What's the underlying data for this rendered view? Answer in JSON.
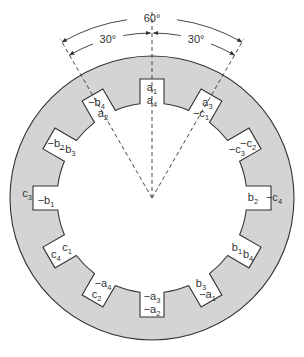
{
  "diagram": {
    "type": "stator-winding-slots",
    "colors": {
      "stator_fill": "#d4d4d4",
      "stroke": "#333333",
      "background": "#ffffff"
    },
    "geometry": {
      "center": [
        152,
        198
      ],
      "outer_radius": 142,
      "inner_radius": 95,
      "slot_outer_radius": 119,
      "slot_half_width": 12,
      "slot_count": 12,
      "slot_pitch_deg": 30
    },
    "dimensions": {
      "total": "60°",
      "left": "30°",
      "right": "30°"
    },
    "slots": [
      {
        "angle": 0,
        "outer": {
          "sign": "",
          "letter": "a",
          "sub": "1"
        },
        "inner": {
          "sign": "",
          "letter": "a",
          "sub": "4"
        }
      },
      {
        "angle": 30,
        "outer": {
          "sign": "",
          "letter": "a",
          "sub": "3"
        },
        "inner": {
          "sign": "−",
          "letter": "c",
          "sub": "1"
        }
      },
      {
        "angle": 60,
        "outer": {
          "sign": "−",
          "letter": "c",
          "sub": "2"
        },
        "inner": {
          "sign": "−",
          "letter": "c",
          "sub": "3"
        }
      },
      {
        "angle": 90,
        "outer": {
          "sign": "−",
          "letter": "c",
          "sub": "4"
        },
        "inner": {
          "sign": "",
          "letter": "b",
          "sub": "2"
        }
      },
      {
        "angle": 120,
        "outer": {
          "sign": "",
          "letter": "b",
          "sub": "4"
        },
        "inner": {
          "sign": "",
          "letter": "b",
          "sub": "1"
        }
      },
      {
        "angle": 150,
        "outer": {
          "sign": "−",
          "letter": "a",
          "sub": "1"
        },
        "inner": {
          "sign": "",
          "letter": "b",
          "sub": "3"
        }
      },
      {
        "angle": 180,
        "outer": {
          "sign": "−",
          "letter": "a",
          "sub": "2"
        },
        "inner": {
          "sign": "−",
          "letter": "a",
          "sub": "3"
        }
      },
      {
        "angle": 210,
        "outer": {
          "sign": "",
          "letter": "c",
          "sub": "2"
        },
        "inner": {
          "sign": "−",
          "letter": "a",
          "sub": "4"
        }
      },
      {
        "angle": 240,
        "outer": {
          "sign": "",
          "letter": "c",
          "sub": "4"
        },
        "inner": {
          "sign": "",
          "letter": "c",
          "sub": "1"
        }
      },
      {
        "angle": 270,
        "outer": {
          "sign": "",
          "letter": "c",
          "sub": "3"
        },
        "inner": {
          "sign": "−",
          "letter": "b",
          "sub": "1"
        }
      },
      {
        "angle": 300,
        "outer": {
          "sign": "−",
          "letter": "b",
          "sub": "2"
        },
        "inner": {
          "sign": "−",
          "letter": "b",
          "sub": "3"
        }
      },
      {
        "angle": 330,
        "outer": {
          "sign": "−",
          "letter": "b",
          "sub": "4"
        },
        "inner": {
          "sign": "",
          "letter": "a",
          "sub": "2"
        }
      }
    ],
    "slot_labels_text": [
      "a1 a4",
      "a3 −c1",
      "−c2 −c3",
      "b2 −c4",
      "b4 b1",
      "−a1 b3",
      "−a3 −a2",
      "c2 −a4",
      "c4 c1",
      "c3 −b1",
      "−b2 −b3",
      "−b4 a2"
    ]
  }
}
